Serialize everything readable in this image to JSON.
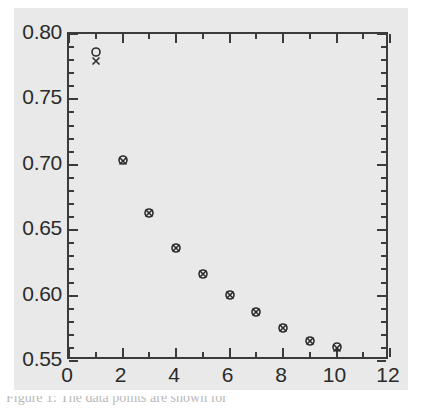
{
  "figure": {
    "background_color": "#e9e9e9",
    "page_color": "#ffffff",
    "axis_color": "#3b3b3b",
    "marker_color": "#2b2b2b",
    "caption_partial": "Figure 1: The data points are shown for"
  },
  "chart_data": {
    "type": "scatter",
    "title": "",
    "xlabel": "",
    "ylabel": "",
    "xlim": [
      0,
      12
    ],
    "ylim": [
      0.55,
      0.8
    ],
    "grid": false,
    "legend_position": "none",
    "x_ticks": [
      0,
      2,
      4,
      6,
      8,
      10,
      12
    ],
    "x_tick_labels": [
      "0",
      "2",
      "4",
      "6",
      "8",
      "10",
      "12"
    ],
    "x_minor_ticks": [
      1,
      3,
      5,
      7,
      9,
      11
    ],
    "y_ticks": [
      0.55,
      0.6,
      0.65,
      0.7,
      0.75,
      0.8
    ],
    "y_tick_labels": [
      "0.55",
      "0.60",
      "0.65",
      "0.70",
      "0.75",
      "0.80"
    ],
    "y_minor_ticks": [
      0.56,
      0.57,
      0.58,
      0.59,
      0.61,
      0.62,
      0.63,
      0.64,
      0.66,
      0.67,
      0.68,
      0.69,
      0.71,
      0.72,
      0.73,
      0.74,
      0.76,
      0.77,
      0.78,
      0.79
    ],
    "x": [
      1,
      2,
      3,
      4,
      5,
      6,
      7,
      8,
      9,
      10
    ],
    "series": [
      {
        "name": "circle-series",
        "marker": "circle",
        "values": [
          0.786,
          0.7035,
          0.6635,
          0.6365,
          0.6165,
          0.6005,
          0.5875,
          0.5755,
          0.5655,
          0.5605
        ]
      },
      {
        "name": "cross-series",
        "marker": "x",
        "values": [
          0.779,
          0.7028,
          0.6632,
          0.6362,
          0.6162,
          0.6003,
          0.5873,
          0.5753,
          0.5653,
          0.5603
        ]
      }
    ]
  }
}
